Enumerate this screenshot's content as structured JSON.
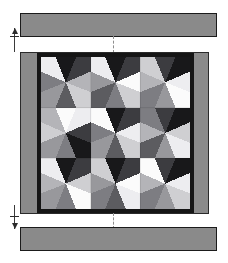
{
  "figure": {
    "type": "quilt-layout-diagram"
  },
  "colors": {
    "page_background": "#ffffff",
    "strip_fill": "#8a8a8a",
    "strip_outline": "#1b1b1b",
    "outer_border_fill": "#8a8a8a",
    "outer_border_outline": "#2a2a2a",
    "inner_border_fill": "#151515",
    "center_background": "#a8a8a8",
    "guide_line": "#3a3a3a",
    "arrow_fill": "#2b2b2b",
    "center_mark": "#8e8e8e"
  },
  "strips": {
    "top": {
      "name": "top border strip",
      "fill": "#8a8a8a"
    },
    "bottom": {
      "name": "bottom border strip",
      "fill": "#8a8a8a"
    }
  },
  "guides": {
    "top_dimension": {
      "name": "top border width dimension",
      "arrow": "up"
    },
    "bottom_dimension": {
      "name": "bottom border width dimension",
      "arrow": "down"
    },
    "center_registration": {
      "name": "vertical centre line",
      "style": "dashed"
    }
  },
  "chart_data": {
    "type": "heatmap",
    "xlabel": "",
    "ylabel": "",
    "grid_rows": 3,
    "grid_cols": 3,
    "block_pattern": "eight-pointed LeMoyne star",
    "legend_position": "none",
    "palette": {
      "black": "#18181a",
      "charcoal": "#3c3c40",
      "dark_gray": "#5c5c60",
      "mid_gray": "#7d7d82",
      "gray": "#98989c",
      "light_gray": "#b4b4b8",
      "pale_gray": "#cfcfd2",
      "near_white": "#ededf0",
      "white": "#fbfbfb"
    },
    "blocks": [
      {
        "row": 0,
        "col": 0,
        "background": "#a8a8a8",
        "star_points": [
          "#18181a",
          "#3c3c40",
          "#b4b4b8",
          "#cfcfd2",
          "#5c5c60",
          "#98989c",
          "#7d7d82",
          "#ededf0"
        ],
        "corners": [
          "#b4b4b8",
          "#98989c",
          "#a8a8a8",
          "#98989c"
        ]
      },
      {
        "row": 0,
        "col": 1,
        "background": "#a8a8a8",
        "star_points": [
          "#18181a",
          "#3c3c40",
          "#fbfbfb",
          "#cfcfd2",
          "#7d7d82",
          "#5c5c60",
          "#98989c",
          "#ededf0"
        ],
        "corners": [
          "#98989c",
          "#b4b4b8",
          "#98989c",
          "#a8a8a8"
        ]
      },
      {
        "row": 0,
        "col": 2,
        "background": "#a8a8a8",
        "star_points": [
          "#3c3c40",
          "#18181a",
          "#ededf0",
          "#fbfbfb",
          "#98989c",
          "#7d7d82",
          "#b4b4b8",
          "#cfcfd2"
        ],
        "corners": [
          "#a8a8a8",
          "#98989c",
          "#b4b4b8",
          "#98989c"
        ]
      },
      {
        "row": 1,
        "col": 0,
        "background": "#a8a8a8",
        "star_points": [
          "#fbfbfb",
          "#ededf0",
          "#3c3c40",
          "#18181a",
          "#7d7d82",
          "#98989c",
          "#cfcfd2",
          "#b4b4b8"
        ],
        "corners": [
          "#98989c",
          "#a8a8a8",
          "#98989c",
          "#b4b4b8"
        ]
      },
      {
        "row": 1,
        "col": 1,
        "background": "#a8a8a8",
        "star_points": [
          "#18181a",
          "#3c3c40",
          "#ededf0",
          "#cfcfd2",
          "#5c5c60",
          "#98989c",
          "#7d7d82",
          "#fbfbfb"
        ],
        "corners": [
          "#b4b4b8",
          "#98989c",
          "#a8a8a8",
          "#cfcfd2"
        ]
      },
      {
        "row": 1,
        "col": 2,
        "background": "#a8a8a8",
        "star_points": [
          "#3c3c40",
          "#18181a",
          "#cfcfd2",
          "#ededf0",
          "#98989c",
          "#5c5c60",
          "#b4b4b8",
          "#7d7d82"
        ],
        "corners": [
          "#98989c",
          "#b4b4b8",
          "#a8a8a8",
          "#98989c"
        ]
      },
      {
        "row": 2,
        "col": 0,
        "background": "#a8a8a8",
        "star_points": [
          "#18181a",
          "#3c3c40",
          "#cfcfd2",
          "#fbfbfb",
          "#7d7d82",
          "#98989c",
          "#b4b4b8",
          "#ededf0"
        ],
        "corners": [
          "#a8a8a8",
          "#98989c",
          "#b4b4b8",
          "#98989c"
        ]
      },
      {
        "row": 2,
        "col": 1,
        "background": "#a8a8a8",
        "star_points": [
          "#18181a",
          "#3c3c40",
          "#fbfbfb",
          "#ededf0",
          "#5c5c60",
          "#7d7d82",
          "#98989c",
          "#cfcfd2"
        ],
        "corners": [
          "#98989c",
          "#b4b4b8",
          "#98989c",
          "#a8a8a8"
        ]
      },
      {
        "row": 2,
        "col": 2,
        "background": "#a8a8a8",
        "star_points": [
          "#3c3c40",
          "#18181a",
          "#ededf0",
          "#cfcfd2",
          "#98989c",
          "#7d7d82",
          "#b4b4b8",
          "#fbfbfb"
        ],
        "corners": [
          "#b4b4b8",
          "#98989c",
          "#a8a8a8",
          "#98989c"
        ]
      }
    ]
  }
}
